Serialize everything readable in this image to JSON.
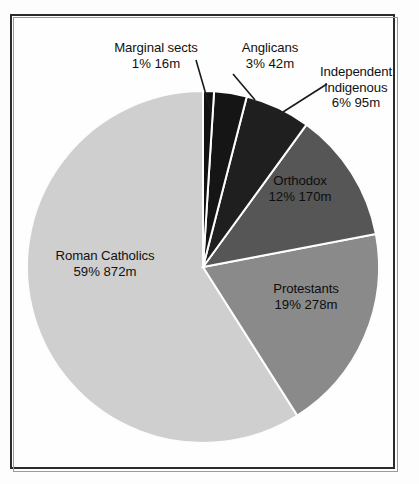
{
  "figure": {
    "name": "world-religions-pie-chart",
    "background_color": "#fdfdfd",
    "frame_color": "#2b2b2b"
  },
  "chart_data": {
    "type": "pie",
    "title": "",
    "subtitle": "",
    "xlabel": "",
    "ylabel": "",
    "grid": false,
    "legend_position": "none",
    "units": "millions of adherents",
    "total_percent": 100,
    "start_angle_deg": 90,
    "direction": "clockwise",
    "categories": [
      "Marginal sects",
      "Anglicans",
      "Independent indigenous",
      "Orthodox",
      "Protestants",
      "Roman Catholics"
    ],
    "values": [
      1,
      3,
      6,
      12,
      19,
      59
    ],
    "absolute_values_millions": [
      16,
      42,
      95,
      170,
      278,
      872
    ],
    "colors": [
      "#121212",
      "#151515",
      "#1f1f1f",
      "#565656",
      "#8a8a8a",
      "#cfcfcf"
    ],
    "slices": [
      {
        "label": "Marginal sects",
        "percent": 1,
        "percent_text": "1%",
        "value_text": "16m",
        "value_millions": 16,
        "color": "#121212",
        "label_placement": "outside",
        "has_leader_line": true
      },
      {
        "label": "Anglicans",
        "percent": 3,
        "percent_text": "3%",
        "value_text": "42m",
        "value_millions": 42,
        "color": "#151515",
        "label_placement": "outside",
        "has_leader_line": true
      },
      {
        "label": "Independent indigenous",
        "label_line1": "Independent",
        "label_line2": "indigenous",
        "percent": 6,
        "percent_text": "6%",
        "value_text": "95m",
        "value_millions": 95,
        "color": "#1f1f1f",
        "label_placement": "outside",
        "has_leader_line": true
      },
      {
        "label": "Orthodox",
        "percent": 12,
        "percent_text": "12%",
        "value_text": "170m",
        "value_millions": 170,
        "color": "#565656",
        "label_placement": "inside",
        "has_leader_line": false
      },
      {
        "label": "Protestants",
        "percent": 19,
        "percent_text": "19%",
        "value_text": "278m",
        "value_millions": 278,
        "color": "#8a8a8a",
        "label_placement": "inside",
        "has_leader_line": false
      },
      {
        "label": "Roman Catholics",
        "percent": 59,
        "percent_text": "59%",
        "value_text": "872m",
        "value_millions": 872,
        "color": "#cfcfcf",
        "label_placement": "inside",
        "has_leader_line": false
      }
    ]
  },
  "labels": {
    "marginal_sects": {
      "line1": "Marginal sects",
      "line2": "1%  16m"
    },
    "anglicans": {
      "line1": "Anglicans",
      "line2": "3%  42m"
    },
    "independent_indigenous": {
      "line1": "Independent",
      "line2": "indigenous",
      "line3": "6%  95m"
    },
    "orthodox": {
      "line1": "Orthodox",
      "line2": "12%  170m"
    },
    "protestants": {
      "line1": "Protestants",
      "line2": "19%  278m"
    },
    "roman_catholics": {
      "line1": "Roman Catholics",
      "line2": "59%  872m"
    }
  }
}
